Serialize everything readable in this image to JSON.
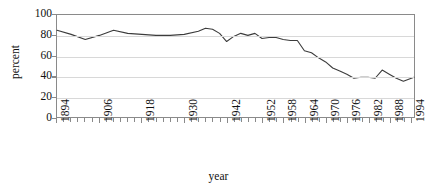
{
  "chart_data": {
    "type": "line",
    "title": "",
    "xlabel": "year",
    "ylabel": "percent",
    "xlim": [
      1894,
      1995
    ],
    "ylim": [
      0,
      100
    ],
    "grid": true,
    "legend": "none",
    "y_ticks": [
      100,
      80,
      60,
      40,
      20,
      0
    ],
    "x_tick_labels": [
      "1894",
      "1906",
      "1918",
      "1930",
      "1942",
      "1952",
      "1958",
      "1964",
      "1970",
      "1976",
      "1982",
      "1988",
      "1994"
    ],
    "x_tick_label_years": [
      1894,
      1906,
      1918,
      1930,
      1942,
      1952,
      1958,
      1964,
      1970,
      1976,
      1982,
      1988,
      1994
    ],
    "line_color": "#3c3c3c",
    "grid_color": "#d8d8d8",
    "axis_color": "#8a8a8a",
    "series": [
      {
        "name": "percent",
        "x": [
          1894,
          1898,
          1902,
          1906,
          1910,
          1914,
          1918,
          1922,
          1926,
          1930,
          1934,
          1936,
          1938,
          1940,
          1942,
          1944,
          1946,
          1948,
          1950,
          1952,
          1954,
          1956,
          1958,
          1960,
          1962,
          1964,
          1966,
          1968,
          1970,
          1972,
          1974,
          1976,
          1978,
          1980,
          1982,
          1984,
          1986,
          1988,
          1990,
          1992,
          1995
        ],
        "values": [
          85,
          81,
          76,
          80,
          85,
          82,
          81,
          80,
          80,
          81,
          84,
          87,
          86,
          82,
          74,
          79,
          82,
          80,
          82,
          77,
          78,
          78,
          76,
          75,
          75,
          65,
          63,
          58,
          54,
          48,
          45,
          42,
          38,
          39,
          39,
          38,
          46,
          42,
          38,
          35,
          39
        ]
      }
    ]
  }
}
